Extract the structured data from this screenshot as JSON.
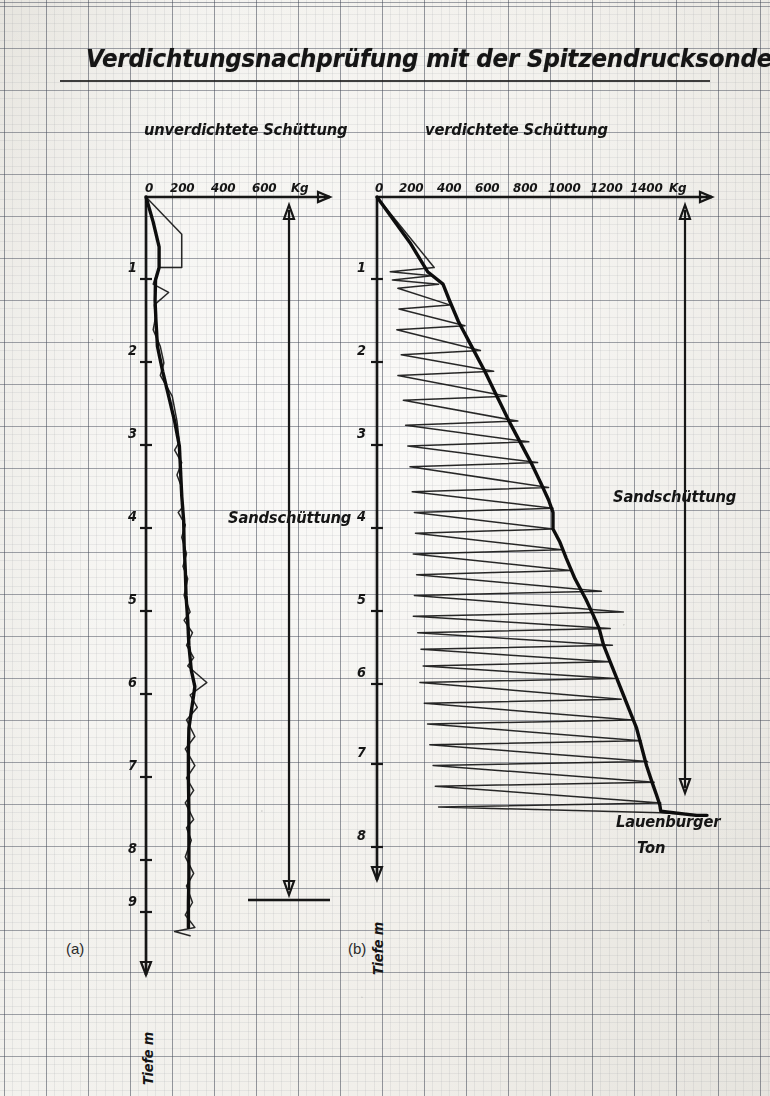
{
  "figure": {
    "title": "Verdichtungsnachprüfung mit der Spitzendrucksonde",
    "panel_a_tag": "(a)",
    "panel_b_tag": "(b)",
    "depth_axis_label": "Tiefe m",
    "force_unit": "Kg"
  },
  "panels": {
    "left": {
      "subtitle": "unverdichtete Schüttung",
      "x_ticks": [
        "0",
        "200",
        "400",
        "600"
      ],
      "unit": "Kg",
      "depth_ticks": [
        "1",
        "2",
        "3",
        "4",
        "5",
        "6",
        "7",
        "8",
        "9"
      ],
      "material_label": "Sandschüttung"
    },
    "right": {
      "subtitle": "verdichtete Schüttung",
      "x_ticks": [
        "0",
        "200",
        "400",
        "600",
        "800",
        "1000",
        "1200",
        "1400"
      ],
      "unit": "Kg",
      "depth_ticks": [
        "1",
        "2",
        "3",
        "4",
        "5",
        "6",
        "7",
        "8"
      ],
      "material_label": "Sandschüttung",
      "base_layer_label_line1": "Lauenburger",
      "base_layer_label_line2": "Ton"
    }
  },
  "chart_data": {
    "type": "line",
    "title": "Verdichtungsnachprüfung mit der Spitzendrucksonde",
    "xlabel": "Kg",
    "ylabel": "Tiefe m",
    "grid": true,
    "legend": "none",
    "charts": [
      {
        "id": "a",
        "name": "unverdichtete Schüttung",
        "xlim": [
          0,
          700
        ],
        "ylim": [
          0,
          9.6
        ],
        "xticks": [
          0,
          200,
          400,
          600
        ],
        "yticks": [
          1,
          2,
          3,
          4,
          5,
          6,
          7,
          8,
          9
        ],
        "annotations": [
          {
            "text": "Sandschüttung",
            "depth_from": 0.0,
            "depth_to": 9.0
          }
        ],
        "series": [
          {
            "name": "Spitzendruck Hüllkurve (a)",
            "points": [
              [
                0,
                0.0
              ],
              [
                30,
                0.3
              ],
              [
                55,
                0.6
              ],
              [
                55,
                0.85
              ],
              [
                40,
                1.0
              ],
              [
                38,
                1.25
              ],
              [
                42,
                1.5
              ],
              [
                48,
                1.8
              ],
              [
                70,
                2.1
              ],
              [
                95,
                2.4
              ],
              [
                120,
                2.7
              ],
              [
                140,
                3.0
              ],
              [
                145,
                3.3
              ],
              [
                150,
                3.6
              ],
              [
                158,
                3.9
              ],
              [
                160,
                4.2
              ],
              [
                165,
                4.5
              ],
              [
                168,
                4.8
              ],
              [
                175,
                5.1
              ],
              [
                180,
                5.4
              ],
              [
                190,
                5.7
              ],
              [
                205,
                5.9
              ],
              [
                195,
                6.1
              ],
              [
                180,
                6.4
              ],
              [
                178,
                6.7
              ],
              [
                178,
                7.0
              ],
              [
                180,
                7.4
              ],
              [
                180,
                7.8
              ],
              [
                180,
                8.2
              ],
              [
                178,
                8.5
              ],
              [
                178,
                8.8
              ]
            ]
          },
          {
            "name": "Messzacken (a)",
            "points": [
              [
                0,
                0.0
              ],
              [
                150,
                0.45
              ],
              [
                150,
                0.85
              ],
              [
                55,
                0.85
              ],
              [
                30,
                1.05
              ],
              [
                95,
                1.15
              ],
              [
                35,
                1.3
              ],
              [
                40,
                1.45
              ],
              [
                30,
                1.6
              ],
              [
                60,
                1.8
              ],
              [
                75,
                2.0
              ],
              [
                60,
                2.15
              ],
              [
                110,
                2.4
              ],
              [
                130,
                2.7
              ],
              [
                140,
                2.95
              ],
              [
                120,
                3.05
              ],
              [
                150,
                3.2
              ],
              [
                130,
                3.35
              ],
              [
                150,
                3.5
              ],
              [
                150,
                3.75
              ],
              [
                135,
                3.8
              ],
              [
                165,
                3.95
              ],
              [
                150,
                4.1
              ],
              [
                170,
                4.3
              ],
              [
                155,
                4.45
              ],
              [
                175,
                4.6
              ],
              [
                160,
                4.8
              ],
              [
                185,
                5.0
              ],
              [
                160,
                5.1
              ],
              [
                195,
                5.25
              ],
              [
                170,
                5.4
              ],
              [
                200,
                5.55
              ],
              [
                175,
                5.65
              ],
              [
                255,
                5.85
              ],
              [
                185,
                6.0
              ],
              [
                215,
                6.15
              ],
              [
                170,
                6.3
              ],
              [
                205,
                6.5
              ],
              [
                165,
                6.65
              ],
              [
                205,
                6.85
              ],
              [
                170,
                7.0
              ],
              [
                200,
                7.15
              ],
              [
                165,
                7.3
              ],
              [
                200,
                7.5
              ],
              [
                170,
                7.6
              ],
              [
                190,
                7.75
              ],
              [
                165,
                7.95
              ],
              [
                200,
                8.15
              ],
              [
                170,
                8.3
              ],
              [
                195,
                8.5
              ],
              [
                165,
                8.65
              ],
              [
                205,
                8.8
              ],
              [
                120,
                8.85
              ],
              [
                185,
                8.9
              ]
            ]
          }
        ]
      },
      {
        "id": "b",
        "name": "verdichtete Schüttung",
        "xlim": [
          0,
          1500
        ],
        "ylim": [
          0,
          8.4
        ],
        "xticks": [
          0,
          200,
          400,
          600,
          800,
          1000,
          1200,
          1400
        ],
        "yticks": [
          1,
          2,
          3,
          4,
          5,
          6,
          7,
          8
        ],
        "annotations": [
          {
            "text": "Sandschüttung",
            "depth_from": 0.0,
            "depth_to": 7.4
          },
          {
            "text": "Lauenburger Ton",
            "depth_from": 7.4,
            "depth_to": 8.4
          }
        ],
        "series": [
          {
            "name": "Spitzendruck Hüllkurve (b)",
            "points": [
              [
                0,
                0.0
              ],
              [
                150,
                0.55
              ],
              [
                230,
                0.9
              ],
              [
                300,
                1.05
              ],
              [
                330,
                1.25
              ],
              [
                370,
                1.5
              ],
              [
                430,
                1.8
              ],
              [
                490,
                2.1
              ],
              [
                545,
                2.4
              ],
              [
                600,
                2.7
              ],
              [
                650,
                2.95
              ],
              [
                700,
                3.2
              ],
              [
                745,
                3.45
              ],
              [
                780,
                3.65
              ],
              [
                800,
                3.8
              ],
              [
                800,
                4.0
              ],
              [
                830,
                4.15
              ],
              [
                860,
                4.35
              ],
              [
                900,
                4.6
              ],
              [
                950,
                4.85
              ],
              [
                985,
                5.05
              ],
              [
                1010,
                5.2
              ],
              [
                1030,
                5.4
              ],
              [
                1060,
                5.6
              ],
              [
                1090,
                5.8
              ],
              [
                1120,
                6.0
              ],
              [
                1150,
                6.2
              ],
              [
                1180,
                6.4
              ],
              [
                1200,
                6.6
              ],
              [
                1225,
                6.85
              ],
              [
                1250,
                7.05
              ],
              [
                1270,
                7.2
              ],
              [
                1285,
                7.32
              ],
              [
                1290,
                7.4
              ],
              [
                1450,
                7.45
              ],
              [
                1500,
                7.45
              ]
            ]
          },
          {
            "name": "Messzacken (b)",
            "points": [
              [
                0,
                0.0
              ],
              [
                260,
                0.85
              ],
              [
                60,
                0.9
              ],
              [
                250,
                0.95
              ],
              [
                70,
                1.0
              ],
              [
                280,
                1.05
              ],
              [
                95,
                1.1
              ],
              [
                330,
                1.3
              ],
              [
                100,
                1.35
              ],
              [
                400,
                1.55
              ],
              [
                90,
                1.6
              ],
              [
                470,
                1.85
              ],
              [
                110,
                1.9
              ],
              [
                530,
                2.1
              ],
              [
                95,
                2.15
              ],
              [
                590,
                2.4
              ],
              [
                120,
                2.45
              ],
              [
                640,
                2.7
              ],
              [
                130,
                2.75
              ],
              [
                690,
                2.95
              ],
              [
                140,
                3.0
              ],
              [
                730,
                3.2
              ],
              [
                150,
                3.25
              ],
              [
                780,
                3.5
              ],
              [
                160,
                3.55
              ],
              [
                800,
                3.75
              ],
              [
                170,
                3.8
              ],
              [
                800,
                4.0
              ],
              [
                175,
                4.05
              ],
              [
                840,
                4.25
              ],
              [
                165,
                4.3
              ],
              [
                880,
                4.5
              ],
              [
                180,
                4.55
              ],
              [
                1020,
                4.75
              ],
              [
                170,
                4.8
              ],
              [
                1120,
                5.0
              ],
              [
                165,
                5.05
              ],
              [
                1060,
                5.2
              ],
              [
                185,
                5.25
              ],
              [
                1070,
                5.4
              ],
              [
                200,
                5.45
              ],
              [
                1060,
                5.6
              ],
              [
                210,
                5.65
              ],
              [
                1080,
                5.8
              ],
              [
                195,
                5.85
              ],
              [
                1110,
                6.05
              ],
              [
                215,
                6.1
              ],
              [
                1160,
                6.3
              ],
              [
                230,
                6.35
              ],
              [
                1200,
                6.55
              ],
              [
                240,
                6.6
              ],
              [
                1230,
                6.8
              ],
              [
                255,
                6.85
              ],
              [
                1260,
                7.05
              ],
              [
                265,
                7.1
              ],
              [
                1290,
                7.3
              ],
              [
                280,
                7.35
              ],
              [
                1290,
                7.42
              ],
              [
                1500,
                7.45
              ]
            ]
          }
        ]
      }
    ]
  }
}
